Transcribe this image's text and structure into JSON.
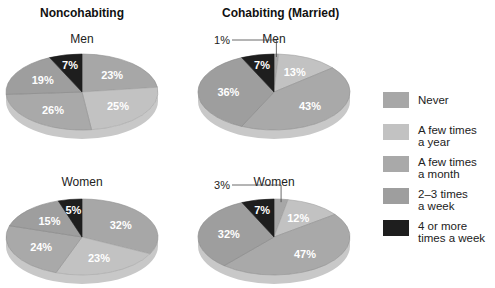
{
  "columns": [
    {
      "title": "Noncohabiting"
    },
    {
      "title": "Cohabiting (Married)"
    }
  ],
  "legend": [
    {
      "label": "Never",
      "color": "#a7a7a7"
    },
    {
      "label": "A few times\na year",
      "color": "#c2c2c2"
    },
    {
      "label": "A few times\na month",
      "color": "#a9a9a9"
    },
    {
      "label": "2–3 times\na week",
      "color": "#9e9e9e"
    },
    {
      "label": "4 or more\ntimes a week",
      "color": "#1e1e1e"
    }
  ],
  "chart_data": [
    {
      "type": "pie",
      "title": "Noncohabiting — Men",
      "categories": [
        "Never",
        "A few times a year",
        "A few times a month",
        "2–3 times a week",
        "4 or more times a week"
      ],
      "values": [
        23,
        25,
        26,
        19,
        7
      ],
      "labels": [
        "23%",
        "25%",
        "26%",
        "19%",
        "7%"
      ]
    },
    {
      "type": "pie",
      "title": "Cohabiting (Married) — Men",
      "categories": [
        "Never",
        "A few times a year",
        "A few times a month",
        "2–3 times a week",
        "4 or more times a week"
      ],
      "values": [
        1,
        13,
        43,
        36,
        7
      ],
      "labels": [
        "1%",
        "13%",
        "43%",
        "36%",
        "7%"
      ]
    },
    {
      "type": "pie",
      "title": "Noncohabiting — Women",
      "categories": [
        "Never",
        "A few times a year",
        "A few times a month",
        "2–3 times a week",
        "4 or more times a week"
      ],
      "values": [
        32,
        23,
        24,
        15,
        5
      ],
      "labels": [
        "32%",
        "23%",
        "24%",
        "15%",
        "5%"
      ]
    },
    {
      "type": "pie",
      "title": "Cohabiting (Married) — Women",
      "categories": [
        "Never",
        "A few times a year",
        "A few times a month",
        "2–3 times a week",
        "4 or more times a week"
      ],
      "values": [
        3,
        12,
        47,
        32,
        7
      ],
      "labels": [
        "3%",
        "12%",
        "47%",
        "32%",
        "7%"
      ]
    }
  ],
  "pies": [
    {
      "row_label": "Men",
      "cx": 82,
      "cy": 92,
      "title_x": 32,
      "title_y": 32
    },
    {
      "row_label": "Men",
      "cx": 274,
      "cy": 92,
      "title_x": 224,
      "title_y": 32
    },
    {
      "row_label": "Women",
      "cx": 82,
      "cy": 237,
      "title_x": 32,
      "title_y": 175
    },
    {
      "row_label": "Women",
      "cx": 274,
      "cy": 237,
      "title_x": 224,
      "title_y": 175
    }
  ]
}
